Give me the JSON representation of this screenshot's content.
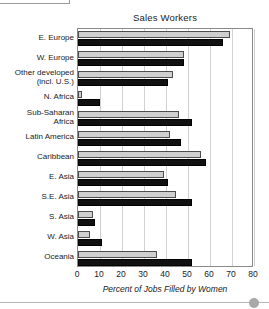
{
  "chart_data": {
    "type": "bar",
    "orientation": "horizontal",
    "title": "Sales Workers",
    "xlabel": "Percent of Jobs Filled by Women",
    "ylabel": "",
    "xlim": [
      0,
      80
    ],
    "xticks": [
      0,
      10,
      20,
      30,
      40,
      50,
      60,
      70,
      80
    ],
    "xtick_labels": [
      "0",
      "10",
      "20",
      "30",
      "40",
      "50",
      "60",
      "70",
      "80"
    ],
    "grid": "vertical",
    "legend": "none",
    "categories": [
      "E. Europe",
      "W. Europe",
      "Other developed (incl. U.S.)",
      "N. Africa",
      "Sub-Saharan Africa",
      "Latin America",
      "Caribbean",
      "E. Asia",
      "S.E. Asia",
      "S. Asia",
      "W. Asia",
      "Oceania"
    ],
    "category_label_lines": [
      [
        "E. Europe"
      ],
      [
        "W. Europe"
      ],
      [
        "Other developed",
        "(incl. U.S.)"
      ],
      [
        "N. Africa"
      ],
      [
        "Sub-Saharan",
        "Africa"
      ],
      [
        "Latin America"
      ],
      [
        "Caribbean"
      ],
      [
        "E. Asia"
      ],
      [
        "S.E. Asia"
      ],
      [
        "S. Asia"
      ],
      [
        "W. Asia"
      ],
      [
        "Oceania"
      ]
    ],
    "series": [
      {
        "name": "light",
        "color": "#cfcfcf",
        "values": [
          69,
          48,
          43,
          2,
          46,
          42,
          56,
          39,
          44.5,
          7,
          5.5,
          36
        ]
      },
      {
        "name": "dark",
        "color": "#111111",
        "values": [
          66,
          48,
          41,
          10,
          52,
          47,
          58,
          41,
          52,
          7.5,
          11,
          52
        ]
      }
    ]
  }
}
